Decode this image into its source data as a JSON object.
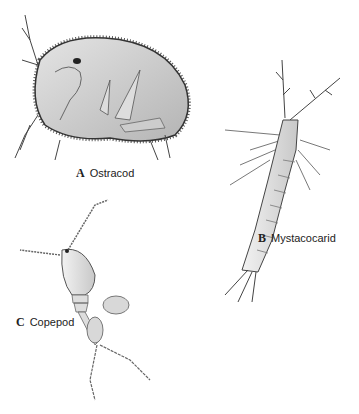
{
  "figure": {
    "panels": [
      {
        "letter": "A",
        "name": "Ostracod"
      },
      {
        "letter": "B",
        "name": "Mystacocarid"
      },
      {
        "letter": "C",
        "name": "Copepod"
      }
    ]
  }
}
